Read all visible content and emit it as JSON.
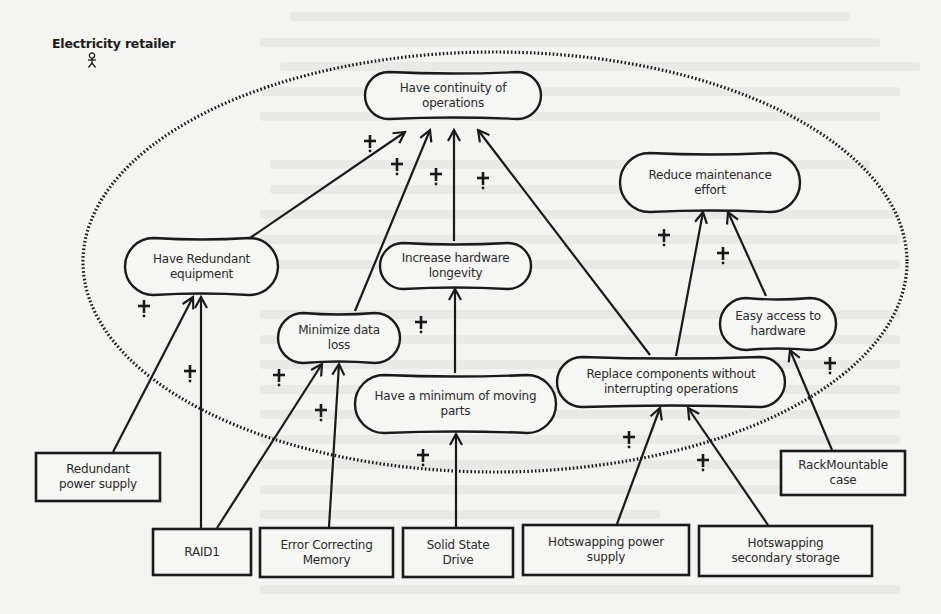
{
  "actor": {
    "label": "Electricity retailer",
    "icon": "actor-stick-figure-icon"
  },
  "boundary": {
    "style": "dotted-ellipse",
    "color": "#1a1a1a"
  },
  "colors": {
    "stroke": "#1a1a1a",
    "background": "#f4f4f2",
    "text": "#2a2a2a"
  },
  "contribution_label": "+",
  "softgoals": [
    {
      "id": "continuity",
      "label": "Have continuity of operations",
      "lines": [
        "Have continuity of",
        "operations"
      ],
      "x": 365,
      "y": 72,
      "w": 176,
      "h": 47
    },
    {
      "id": "maintenance",
      "label": "Reduce maintenance effort",
      "lines": [
        "Reduce maintenance",
        "effort"
      ],
      "x": 620,
      "y": 153,
      "w": 180,
      "h": 59
    },
    {
      "id": "redundant",
      "label": "Have Redundant equipment",
      "lines": [
        "Have Redundant",
        "equipment"
      ],
      "x": 125,
      "y": 238,
      "w": 153,
      "h": 57
    },
    {
      "id": "longevity",
      "label": "Increase hardware longevity",
      "lines": [
        "Increase hardware",
        "longevity"
      ],
      "x": 380,
      "y": 243,
      "w": 151,
      "h": 46
    },
    {
      "id": "dataloss",
      "label": "Minimize data loss",
      "lines": [
        "Minimize data",
        "loss"
      ],
      "x": 278,
      "y": 313,
      "w": 122,
      "h": 50
    },
    {
      "id": "access",
      "label": "Easy access to hardware",
      "lines": [
        "Easy access to",
        "hardware"
      ],
      "x": 720,
      "y": 298,
      "w": 116,
      "h": 52
    },
    {
      "id": "movingparts",
      "label": "Have a minimum of moving parts",
      "lines": [
        "Have a minimum of moving",
        "parts"
      ],
      "x": 355,
      "y": 375,
      "w": 201,
      "h": 58
    },
    {
      "id": "replace",
      "label": "Replace components without interrupting operations",
      "lines": [
        "Replace components without",
        "interrupting operations"
      ],
      "x": 557,
      "y": 357,
      "w": 228,
      "h": 50
    }
  ],
  "tasks": [
    {
      "id": "rps",
      "label": "Redundant power supply",
      "lines": [
        "Redundant",
        "power supply"
      ],
      "x": 36,
      "y": 453,
      "w": 124,
      "h": 48
    },
    {
      "id": "rack",
      "label": "RackMountable case",
      "lines": [
        "RackMountable",
        "case"
      ],
      "x": 781,
      "y": 451,
      "w": 124,
      "h": 44
    },
    {
      "id": "raid",
      "label": "RAID1",
      "lines": [
        "RAID1"
      ],
      "x": 153,
      "y": 529,
      "w": 98,
      "h": 46
    },
    {
      "id": "ecc",
      "label": "Error Correcting Memory",
      "lines": [
        "Error Correcting",
        "Memory"
      ],
      "x": 260,
      "y": 528,
      "w": 133,
      "h": 49
    },
    {
      "id": "ssd",
      "label": "Solid State Drive",
      "lines": [
        "Solid State",
        "Drive"
      ],
      "x": 403,
      "y": 528,
      "w": 110,
      "h": 49
    },
    {
      "id": "hps",
      "label": "Hotswapping power supply",
      "lines": [
        "Hotswapping power",
        "supply"
      ],
      "x": 523,
      "y": 525,
      "w": 166,
      "h": 50
    },
    {
      "id": "hss",
      "label": "Hotswapping secondary storage",
      "lines": [
        "Hotswapping",
        "secondary storage"
      ],
      "x": 699,
      "y": 526,
      "w": 173,
      "h": 50
    }
  ],
  "links": [
    {
      "from": "redundant",
      "to": "continuity",
      "x1": 250,
      "y1": 238,
      "x2": 405,
      "y2": 132,
      "label": "+",
      "lx": 370,
      "ly": 141
    },
    {
      "from": "dataloss",
      "to": "continuity",
      "x1": 355,
      "y1": 311,
      "x2": 430,
      "y2": 130,
      "label": "+",
      "lx": 397,
      "ly": 164
    },
    {
      "from": "longevity",
      "to": "continuity",
      "x1": 454,
      "y1": 241,
      "x2": 454,
      "y2": 130,
      "label": "+",
      "lx": 436,
      "ly": 174
    },
    {
      "from": "replace",
      "to": "continuity",
      "x1": 650,
      "y1": 355,
      "x2": 478,
      "y2": 130,
      "label": "+",
      "lx": 483,
      "ly": 178
    },
    {
      "from": "replace",
      "to": "maintenance",
      "x1": 676,
      "y1": 356,
      "x2": 703,
      "y2": 212,
      "label": "+",
      "lx": 664,
      "ly": 235
    },
    {
      "from": "access",
      "to": "maintenance",
      "x1": 766,
      "y1": 296,
      "x2": 728,
      "y2": 212,
      "label": "+",
      "lx": 723,
      "ly": 253
    },
    {
      "from": "rps",
      "to": "redundant",
      "x1": 113,
      "y1": 452,
      "x2": 193,
      "y2": 297,
      "label": "+",
      "lx": 144,
      "ly": 306
    },
    {
      "from": "raid",
      "to": "redundant",
      "x1": 201,
      "y1": 528,
      "x2": 201,
      "y2": 297,
      "label": "+",
      "lx": 190,
      "ly": 371
    },
    {
      "from": "raid",
      "to": "dataloss",
      "x1": 217,
      "y1": 528,
      "x2": 322,
      "y2": 364,
      "label": "+",
      "lx": 279,
      "ly": 375
    },
    {
      "from": "ecc",
      "to": "dataloss",
      "x1": 329,
      "y1": 527,
      "x2": 339,
      "y2": 364,
      "label": "+",
      "lx": 321,
      "ly": 410
    },
    {
      "from": "movingparts",
      "to": "longevity",
      "x1": 455,
      "y1": 373,
      "x2": 455,
      "y2": 289,
      "label": "+",
      "lx": 421,
      "ly": 322
    },
    {
      "from": "ssd",
      "to": "movingparts",
      "x1": 456,
      "y1": 527,
      "x2": 456,
      "y2": 434,
      "label": "+",
      "lx": 423,
      "ly": 455
    },
    {
      "from": "hps",
      "to": "replace",
      "x1": 617,
      "y1": 524,
      "x2": 660,
      "y2": 408,
      "label": "+",
      "lx": 629,
      "ly": 437
    },
    {
      "from": "hss",
      "to": "replace",
      "x1": 768,
      "y1": 525,
      "x2": 688,
      "y2": 408,
      "label": "+",
      "lx": 703,
      "ly": 460
    },
    {
      "from": "rack",
      "to": "access",
      "x1": 832,
      "y1": 450,
      "x2": 790,
      "y2": 350,
      "label": "+",
      "lx": 830,
      "ly": 363
    }
  ]
}
